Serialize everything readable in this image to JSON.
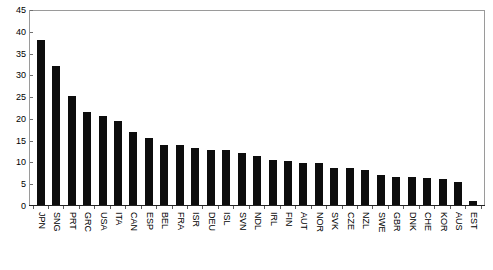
{
  "chart_data": {
    "type": "bar",
    "title": "",
    "subtitle": "",
    "xlabel": "",
    "ylabel": "",
    "ylim": [
      0,
      45
    ],
    "ytick_step": 5,
    "yticks": [
      0,
      5,
      10,
      15,
      20,
      25,
      30,
      35,
      40,
      45
    ],
    "ytick_labels": [
      "0",
      "5",
      "10",
      "15",
      "20",
      "25",
      "30",
      "35",
      "40",
      "45"
    ],
    "grid": false,
    "legend": null,
    "legend_position": "none",
    "bar_color": "#0d0d0d",
    "frame_color": "#9a9a9a",
    "axis_color": "#222222",
    "background_color": "#ffffff",
    "label_rotation": 90,
    "categories": [
      "JPN",
      "SNG",
      "PRT",
      "GRC",
      "USA",
      "ITA",
      "CAN",
      "ESP",
      "BEL",
      "FRA",
      "ISR",
      "DEU",
      "ISL",
      "SVN",
      "NDL",
      "IRL",
      "FIN",
      "AUT",
      "NOR",
      "SVK",
      "CZE",
      "NZL",
      "SWE",
      "GBR",
      "DNK",
      "CHE",
      "KOR",
      "AUS",
      "EST"
    ],
    "values": [
      38.2,
      32.3,
      25.4,
      21.5,
      20.7,
      19.4,
      17.0,
      15.6,
      14.0,
      14.0,
      13.3,
      12.7,
      12.7,
      12.1,
      11.4,
      10.4,
      10.1,
      9.7,
      9.7,
      8.7,
      8.6,
      8.1,
      6.9,
      6.6,
      6.4,
      6.2,
      6.0,
      5.3,
      0.9
    ]
  }
}
